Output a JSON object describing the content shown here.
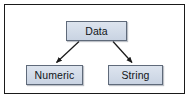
{
  "diagram": {
    "type": "hierarchy-tree",
    "background_color": "#ffffff",
    "frame": {
      "border_color": "#1a1a1a",
      "border_width_px": 2
    },
    "node_style": {
      "fill_color": "#d3dce8",
      "border_color": "#5f6a7a",
      "text_color": "#111418",
      "shape": "rectangle"
    },
    "edge_style": {
      "line_color": "#1a1a1a",
      "arrowhead": "filled-triangle",
      "direction": "parent-to-child"
    },
    "nodes": [
      {
        "id": "data",
        "label": "Data",
        "level": 0
      },
      {
        "id": "numeric",
        "label": "Numeric",
        "level": 1
      },
      {
        "id": "string",
        "label": "String",
        "level": 1
      }
    ],
    "edges": [
      {
        "from": "data",
        "to": "numeric"
      },
      {
        "from": "data",
        "to": "string"
      }
    ]
  }
}
